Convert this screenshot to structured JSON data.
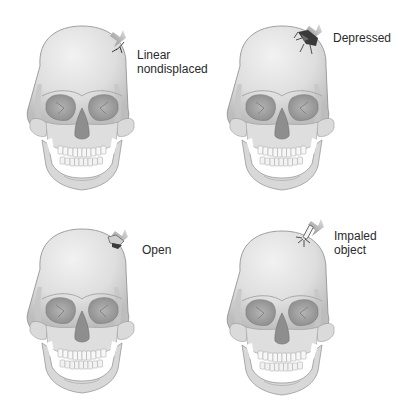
{
  "figure": {
    "panels": [
      {
        "id": "linear",
        "label": "Linear\nnondisplaced",
        "fracture": "linear-crack"
      },
      {
        "id": "depressed",
        "label": "Depressed",
        "fracture": "depressed-crush"
      },
      {
        "id": "open",
        "label": "Open",
        "fracture": "open-flap"
      },
      {
        "id": "impaled",
        "label": "Impaled object",
        "label_lines": "Impaled\nobject",
        "fracture": "impaled-object"
      }
    ],
    "colors": {
      "bone": "#e4e4e4",
      "bone_shadow": "#b8b8b8",
      "outline": "#8a8a8a",
      "orbit": "#9c9c9c",
      "arrow": "#9a9a9a",
      "crack": "#2a2a2a",
      "text": "#2a2a2a"
    }
  }
}
